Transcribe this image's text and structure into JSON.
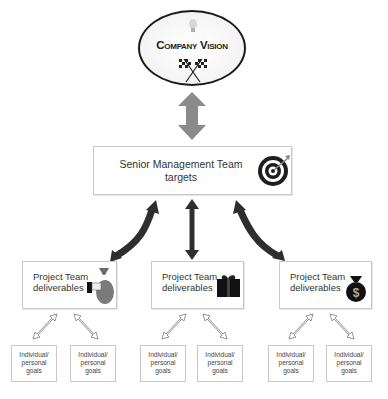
{
  "vision": {
    "title": "Company Vision",
    "icons": [
      "lightbulb-icon",
      "checkered-flags-icon"
    ]
  },
  "senior": {
    "line1": "Senior Management Team",
    "line2": "targets",
    "icon": "target-icon"
  },
  "projects": [
    {
      "line1": "Project Team",
      "line2": "deliverables",
      "icon": "hand-money-bag-icon"
    },
    {
      "line1": "Project Team",
      "line2": "deliverables",
      "icon": "gift-box-icon"
    },
    {
      "line1": "Project Team",
      "line2": "deliverables",
      "icon": "dollar-bag-icon"
    }
  ],
  "individuals": [
    {
      "line1": "Individual/",
      "line2": "personal",
      "line3": "goals"
    },
    {
      "line1": "Individual/",
      "line2": "personal",
      "line3": "goals"
    },
    {
      "line1": "Individual/",
      "line2": "personal",
      "line3": "goals"
    },
    {
      "line1": "Individual/",
      "line2": "personal",
      "line3": "goals"
    },
    {
      "line1": "Individual/",
      "line2": "personal",
      "line3": "goals"
    },
    {
      "line1": "Individual/",
      "line2": "personal",
      "line3": "goals"
    }
  ],
  "colors": {
    "vision_arrow": "#8a8a8a",
    "senior_arrows": "#2e2e2e",
    "box_border": "#c9c9c9",
    "text": "#333333"
  }
}
